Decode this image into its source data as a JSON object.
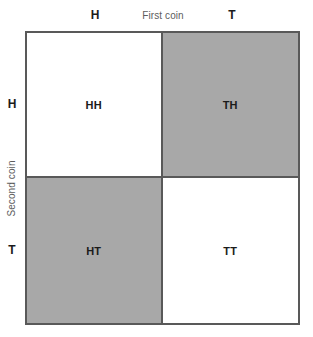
{
  "figure": {
    "title": "",
    "column_axis_label": "First coin",
    "row_axis_label": "Second coin",
    "column_headers": [
      "H",
      "T"
    ],
    "row_headers": [
      "H",
      "T"
    ],
    "colors": {
      "shaded_fill": "#a8a8a8",
      "unshaded_fill": "#ffffff",
      "border": "#595959",
      "label_text": "#1b1b1b",
      "axis_text": "#5d5d5d"
    }
  },
  "chart_data": {
    "type": "table",
    "title": "",
    "xlabel": "First coin",
    "ylabel": "Second coin",
    "categories": [
      "H",
      "T"
    ],
    "row_categories": [
      "H",
      "T"
    ],
    "grid": true,
    "legend": "none",
    "cells": [
      {
        "row": "H",
        "column": "H",
        "label": "HH",
        "shaded": false,
        "fill": "#ffffff"
      },
      {
        "row": "H",
        "column": "T",
        "label": "TH",
        "shaded": true,
        "fill": "#a8a8a8"
      },
      {
        "row": "T",
        "column": "H",
        "label": "HT",
        "shaded": true,
        "fill": "#a8a8a8"
      },
      {
        "row": "T",
        "column": "T",
        "label": "TT",
        "shaded": false,
        "fill": "#ffffff"
      }
    ],
    "shaded_count": 2,
    "total_count": 4
  }
}
